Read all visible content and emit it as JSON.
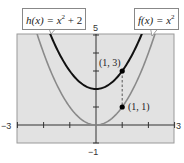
{
  "chart_data": {
    "type": "line",
    "title": "",
    "xlabel": "",
    "ylabel": "",
    "xlim": [
      -3,
      3
    ],
    "ylim": [
      -1,
      5
    ],
    "tick_labels": {
      "x_min": "−3",
      "x_max": "3",
      "y_min": "−1",
      "y_max": "5"
    },
    "grid": false,
    "series": [
      {
        "name": "f(x) = x^2",
        "label_fn": "f(x) = x",
        "label_exp": "2",
        "label_tail": "",
        "color": "#8a8a8a",
        "expr": "x^2",
        "vertex": [
          0,
          0
        ]
      },
      {
        "name": "h(x) = x^2 + 2",
        "label_fn": "h(x) = x",
        "label_exp": "2",
        "label_tail": " + 2",
        "color": "#111111",
        "expr": "x^2 + 2",
        "vertex": [
          0,
          2
        ]
      }
    ],
    "points": [
      {
        "label": "(1, 3)",
        "x": 1,
        "y": 3
      },
      {
        "label": "(1, 1)",
        "x": 1,
        "y": 1
      }
    ],
    "annotations": [
      "dashed vertical segment from (1, 1) to (1, 3)"
    ]
  }
}
